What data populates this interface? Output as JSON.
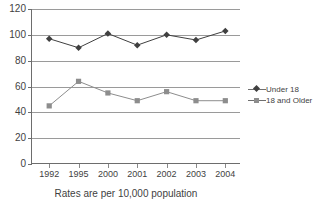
{
  "chart_data": {
    "type": "line",
    "title": "",
    "subtitle": "",
    "xlabel": "",
    "ylabel": "",
    "caption": "Rates are per 10,000 population",
    "categories": [
      "1992",
      "1995",
      "2000",
      "2001",
      "2002",
      "2003",
      "2004"
    ],
    "ylim": [
      0,
      120
    ],
    "ytick_step": 20,
    "yticks": [
      "0",
      "20",
      "40",
      "60",
      "80",
      "100",
      "120"
    ],
    "grid": true,
    "legend_position": "right",
    "series": [
      {
        "name": "Under 18",
        "marker": "diamond",
        "color": "#404040",
        "values": [
          97,
          90,
          101,
          92,
          100,
          96,
          103
        ]
      },
      {
        "name": "18 and Older",
        "marker": "square",
        "color": "#8d8d8d",
        "values": [
          45,
          64,
          55,
          49,
          56,
          49,
          49
        ]
      }
    ]
  },
  "legend": {
    "items": [
      {
        "label": "Under 18",
        "marker": "diamond-marker-icon"
      },
      {
        "label": "18 and Older",
        "marker": "square-marker-icon"
      }
    ]
  }
}
